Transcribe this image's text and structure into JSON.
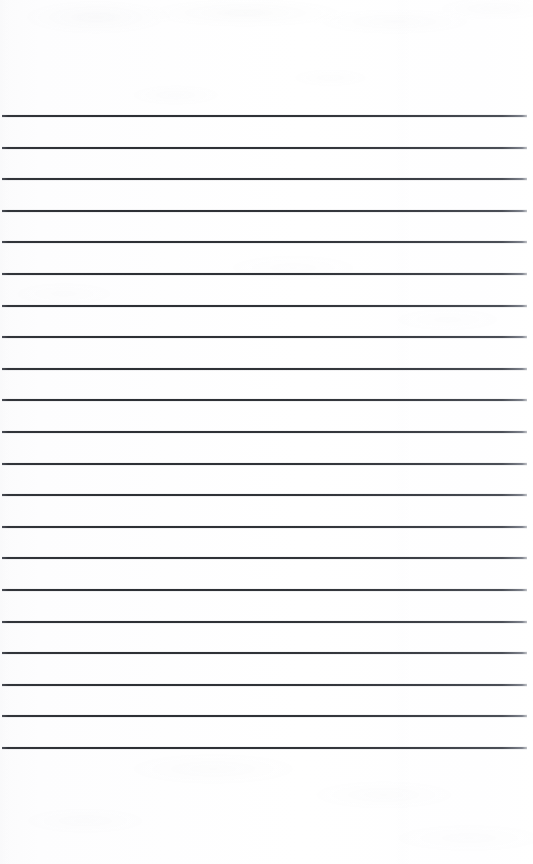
{
  "document": {
    "kind": "scanned-lined-paper",
    "title": "Blank Ruled Paper Sheet",
    "page_width": 533,
    "page_height": 864,
    "background_color": "#fdfdfd",
    "paper_tone": "near-white",
    "has_text_content": false,
    "has_handwriting": false,
    "header_text": "",
    "footer_text": "",
    "body_text": ""
  },
  "ruling": {
    "style": "horizontal ruled lines",
    "line_count": 21,
    "line_color": "#2b2e33",
    "line_color_left": "#303338",
    "line_color_right": "#4a4e56",
    "line_thickness_px": 2,
    "first_line_y": 116,
    "last_line_y": 748,
    "line_spacing_px": 31.6,
    "line_start_x": 2,
    "line_end_x": 527,
    "lines_y": [
      116,
      147.6,
      179.2,
      210.8,
      242.4,
      274,
      305.6,
      337.2,
      368.8,
      400.4,
      432,
      463.6,
      495.2,
      526.8,
      558.4,
      590,
      621.6,
      653.2,
      684.8,
      716.4,
      748
    ]
  },
  "margins": {
    "top_margin_px": 116,
    "bottom_margin_px": 114,
    "left_margin_px": 2,
    "right_margin_px": 6,
    "top_label": "blank top margin",
    "bottom_label": "blank bottom margin"
  },
  "scan_artifacts": {
    "noise_present": true,
    "noise_description": "faint grey mottling near top and bottom edges",
    "edge_highlight_color": "#ffffff",
    "banding_present": true
  }
}
